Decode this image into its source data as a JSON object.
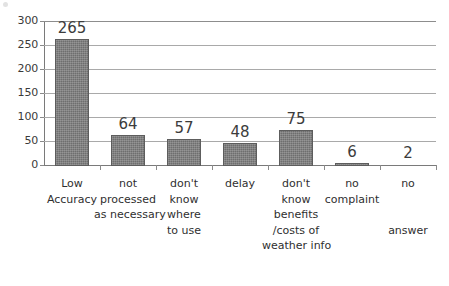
{
  "chart_data": {
    "type": "bar",
    "title": "",
    "subtitle": "",
    "xlabel": "",
    "ylabel": "",
    "ylim": [
      0,
      300
    ],
    "yticks": [
      0,
      50,
      100,
      150,
      200,
      250,
      300
    ],
    "ytick_labels": [
      "0",
      "50",
      "100",
      "150",
      "200",
      "250",
      "300"
    ],
    "grid": true,
    "grid_axis": "y",
    "legend": false,
    "legend_position": "none",
    "bar_color": "#6e6e6e",
    "bar_edge_color": "#5d5d5d",
    "grid_color": "#a9a9a9",
    "axis_color": "#7a7a7a",
    "background": "#ffffff",
    "data_labels": true,
    "categories": [
      "Low Accuracy",
      "not processed as necessary",
      "don't know where to use",
      "delay",
      "don't know benefits /costs of weather info",
      "no complaint",
      "no answer"
    ],
    "category_lines": [
      [
        "Low",
        "Accuracy"
      ],
      [
        "not",
        "processed",
        "as necessary"
      ],
      [
        "don't",
        "know",
        "where",
        "to use"
      ],
      [
        "delay"
      ],
      [
        "don't",
        "know",
        "benefits",
        "/costs of",
        "weather info"
      ],
      [
        "no",
        "complaint"
      ],
      [
        "no",
        "",
        "",
        "answer"
      ]
    ],
    "values": [
      265,
      64,
      57,
      48,
      75,
      6,
      2
    ],
    "value_labels": [
      "265",
      "64",
      "57",
      "48",
      "75",
      "6",
      "2"
    ]
  }
}
